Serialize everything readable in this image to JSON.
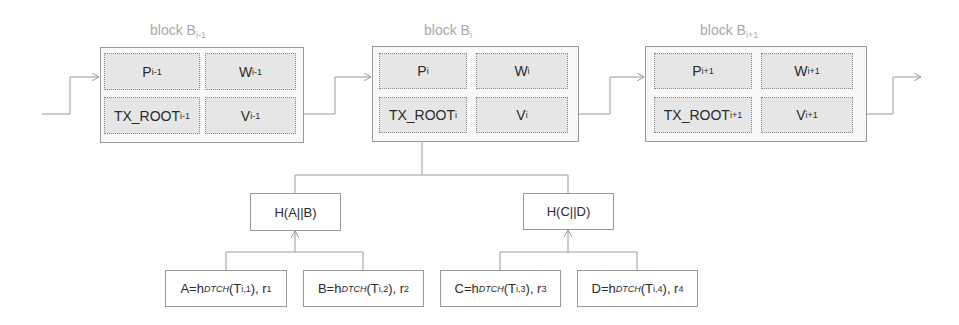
{
  "diagram": {
    "colors": {
      "line": "#9a9a9a",
      "cell_fill": "#e6e6e6",
      "label_gray": "#a8a8a8",
      "text": "#2b2b2b"
    },
    "blocks": [
      {
        "label": "block B",
        "label_sub": "i-1",
        "cells": {
          "p": {
            "base": "P",
            "sub": "i-1"
          },
          "w": {
            "base": "W",
            "sub": "i-1"
          },
          "tx": {
            "base": "TX_ROOT",
            "sub": "i-1"
          },
          "v": {
            "base": "V",
            "sub": "i-1"
          }
        }
      },
      {
        "label": "block B",
        "label_sub": "i",
        "cells": {
          "p": {
            "base": "P",
            "sub": "i"
          },
          "w": {
            "base": "W",
            "sub": "i"
          },
          "tx": {
            "base": "TX_ROOT",
            "sub": "i"
          },
          "v": {
            "base": "V",
            "sub": "i"
          }
        }
      },
      {
        "label": "block B",
        "label_sub": "i+1",
        "cells": {
          "p": {
            "base": "P",
            "sub": "i+1"
          },
          "w": {
            "base": "W",
            "sub": "i+1"
          },
          "tx": {
            "base": "TX_ROOT",
            "sub": "i+1"
          },
          "v": {
            "base": "V",
            "sub": "i+1"
          }
        }
      }
    ],
    "merkle": {
      "internal": [
        {
          "label": "H(A||B)"
        },
        {
          "label": "H(C||D)"
        }
      ],
      "leaves": [
        {
          "prefix": "A=h",
          "hash_sub": "DTCH",
          "open": "(T",
          "t_sub": "i,1",
          "close": "), r",
          "r_sub": "1"
        },
        {
          "prefix": "B=h",
          "hash_sub": "DTCH",
          "open": "(T",
          "t_sub": "i,2",
          "close": "), r",
          "r_sub": "2"
        },
        {
          "prefix": "C=h",
          "hash_sub": "DTCH",
          "open": "(T",
          "t_sub": "i,3",
          "close": "), r",
          "r_sub": "3"
        },
        {
          "prefix": "D=h",
          "hash_sub": "DTCH",
          "open": "(T",
          "t_sub": "i,4",
          "close": "), r",
          "r_sub": "4"
        }
      ]
    }
  }
}
